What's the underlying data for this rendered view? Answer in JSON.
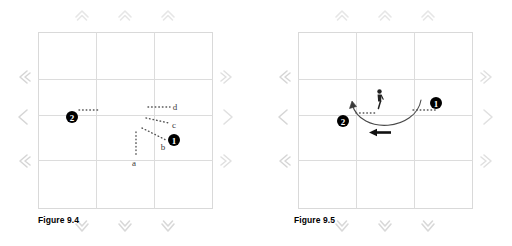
{
  "page": {
    "background_color": "#ffffff",
    "width": 512,
    "height": 246
  },
  "figures": [
    {
      "id": "figure-9-4",
      "caption": "Figure 9.4",
      "court": {
        "border_color": "#d9d9d9",
        "grid_color": "#d9d9d9",
        "columns": 3,
        "rows": 3
      },
      "edge_arrows": {
        "top": {
          "glyph": "chevron-up",
          "count": 3,
          "color": "#e3e3e3"
        },
        "bottom": {
          "glyph": "chevron-down",
          "count": 3,
          "color": "#d4d4d4"
        },
        "left": {
          "glyph": "chevron-left",
          "count": 3,
          "color": "#cfcfcf"
        },
        "right": {
          "glyph": "chevron-right",
          "count": 3,
          "color": "#dcdcdc"
        }
      },
      "markers": [
        {
          "name": "position-marker-2",
          "label": "2",
          "glyph": "❷",
          "color": "#000000"
        },
        {
          "name": "position-marker-1",
          "label": "1",
          "glyph": "❶",
          "color": "#000000"
        }
      ],
      "path_labels": [
        {
          "id": "a",
          "text": "a"
        },
        {
          "id": "b",
          "text": "b"
        },
        {
          "id": "c",
          "text": "c"
        },
        {
          "id": "d",
          "text": "d"
        }
      ],
      "dotted_paths": 5,
      "dot_color": "#555555"
    },
    {
      "id": "figure-9-5",
      "caption": "Figure 9.5",
      "court": {
        "border_color": "#d9d9d9",
        "grid_color": "#d9d9d9",
        "columns": 3,
        "rows": 3
      },
      "edge_arrows": {
        "top": {
          "glyph": "chevron-up",
          "count": 3,
          "color": "#e3e3e3"
        },
        "bottom": {
          "glyph": "chevron-down",
          "count": 3,
          "color": "#d4d4d4"
        },
        "left": {
          "glyph": "chevron-left",
          "count": 3,
          "color": "#cfcfcf"
        },
        "right": {
          "glyph": "chevron-right",
          "count": 3,
          "color": "#dcdcdc"
        }
      },
      "markers": [
        {
          "name": "position-marker-2",
          "label": "2",
          "glyph": "❷",
          "color": "#000000"
        },
        {
          "name": "position-marker-1",
          "label": "1",
          "glyph": "❶",
          "color": "#000000"
        }
      ],
      "player_icon": {
        "name": "player-figure-icon",
        "color": "#222222"
      },
      "arc": {
        "name": "movement-arc",
        "color": "#4a4a4a",
        "direction": "right-to-left"
      },
      "direction_arrow": {
        "name": "direction-arrow-left",
        "color": "#111111"
      },
      "dotted_paths": 2,
      "dot_color": "#555555"
    }
  ]
}
